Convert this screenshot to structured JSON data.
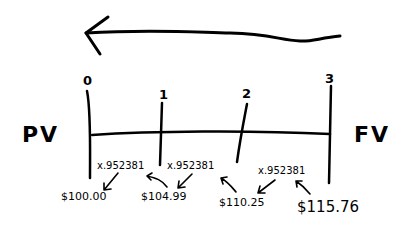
{
  "diagram": {
    "type": "timeline",
    "direction_arrow": "right-to-left",
    "left_label": "PV",
    "right_label": "FV",
    "periods": [
      {
        "label": "0",
        "value": "$100.00"
      },
      {
        "label": "1",
        "value": "$104.99"
      },
      {
        "label": "2",
        "value": "$110.25"
      },
      {
        "label": "3",
        "value": "$115.76"
      }
    ],
    "discount_factors": [
      {
        "from_period": "1",
        "to_period": "0",
        "label": "x.952381"
      },
      {
        "from_period": "2",
        "to_period": "1",
        "label": "x.952381"
      },
      {
        "from_period": "3",
        "to_period": "2",
        "label": "x.952381"
      }
    ],
    "ink_color": "#000000",
    "background_color": "#ffffff"
  }
}
